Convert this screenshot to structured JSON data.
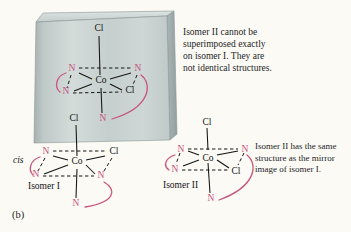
{
  "figure_label": "(b)",
  "labels": {
    "cis": "cis",
    "isomer1": "Isomer I",
    "isomer2": "Isomer II"
  },
  "annotations": {
    "not_superimposable": {
      "lines": [
        "Isomer II cannot be",
        "superimposed exactly",
        "on isomer I. They are",
        "not identical structures."
      ]
    },
    "mirror_image": {
      "lines": [
        "Isomer II has the same",
        "structure as the mirror",
        "image of isomer I."
      ]
    }
  },
  "structures": {
    "mirror_reflection": {
      "atoms": {
        "axial_top": "Cl",
        "center": "Co",
        "plane_tl": "N",
        "plane_tr": "N",
        "plane_bl": "N",
        "plane_br": "Cl",
        "axial_bottom": "N"
      }
    },
    "isomer1": {
      "atoms": {
        "axial_top": "Cl",
        "center": "Co",
        "plane_tl": "N",
        "plane_tr": "Cl",
        "plane_bl": "N",
        "plane_br": "N",
        "axial_bottom": "N"
      }
    },
    "isomer2": {
      "atoms": {
        "axial_top": "Cl",
        "center": "Co",
        "plane_tl": "N",
        "plane_tr": "N",
        "plane_bl": "N",
        "plane_br": "Cl",
        "axial_bottom": "N"
      }
    }
  },
  "colors": {
    "chelate_pink": "#c7547f",
    "ink": "#141414",
    "slab_gray": "#c8d1cf",
    "background": "#fbfaf5"
  }
}
